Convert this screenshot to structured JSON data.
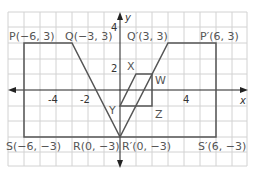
{
  "diagram": {
    "type": "coordinate-plane-transformation",
    "axes": {
      "x_label": "x",
      "y_label": "y",
      "x_ticks": [
        "-4",
        "-2",
        "4"
      ],
      "y_ticks": [
        "4",
        "2"
      ]
    },
    "shape_pqrs": {
      "points": [
        {
          "name": "P",
          "label": "P(−6, 3)",
          "x": -6,
          "y": 3
        },
        {
          "name": "Q",
          "label": "Q(−3, 3)",
          "x": -3,
          "y": 3
        },
        {
          "name": "R",
          "label": "R(0, −3)",
          "x": 0,
          "y": -3
        },
        {
          "name": "S",
          "label": "S(−6, −3)",
          "x": -6,
          "y": -3
        }
      ]
    },
    "shape_image": {
      "points": [
        {
          "name": "P'",
          "label": "P′(6, 3)",
          "x": 6,
          "y": 3
        },
        {
          "name": "Q'",
          "label": "Q′(3, 3)",
          "x": 3,
          "y": 3
        },
        {
          "name": "R'",
          "label": "R′(0, −3)",
          "x": 0,
          "y": -3
        },
        {
          "name": "S'",
          "label": "S′(6, −3)",
          "x": 6,
          "y": -3
        }
      ]
    },
    "parallelogram": {
      "vertices": [
        {
          "name": "X",
          "label": "X"
        },
        {
          "name": "W",
          "label": "W"
        },
        {
          "name": "Z",
          "label": "Z"
        },
        {
          "name": "Y",
          "label": "Y"
        }
      ]
    },
    "colors": {
      "grid": "#cfcfcf",
      "shape": "#555555",
      "axis": "#222222"
    }
  }
}
